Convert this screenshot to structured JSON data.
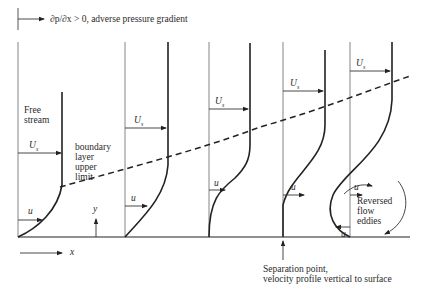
{
  "title": "∂p/∂x > 0, adverse pressure gradient",
  "labels": {
    "free_stream": "Free stream",
    "free_line1": "Free",
    "free_line2": "stream",
    "bl_line1": "boundary",
    "bl_line2": "layer",
    "bl_line3": "upper",
    "bl_line4": "limit",
    "U_s": "U",
    "U_sub": "s",
    "u": "u",
    "y_axis": "y",
    "x_axis": "x",
    "rev1": "Reversed",
    "rev2": "flow",
    "rev3": "eddies",
    "sep1": "Separation point,",
    "sep2": "velocity profile vertical to surface"
  },
  "profiles": [
    {
      "name": "profile-1",
      "description": "developing boundary layer"
    },
    {
      "name": "profile-2",
      "description": "thicker boundary layer"
    },
    {
      "name": "profile-3",
      "description": "inflection profile"
    },
    {
      "name": "profile-4",
      "description": "separation point"
    },
    {
      "name": "profile-5",
      "description": "reversed flow"
    }
  ],
  "colors": {
    "line": "#222222",
    "axis": "#555555"
  }
}
